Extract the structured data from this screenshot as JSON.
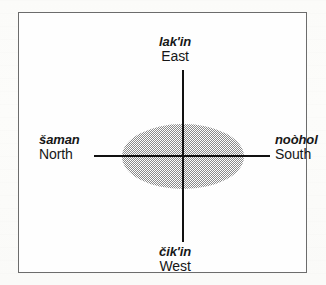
{
  "figure": {
    "type": "cardinal-direction-diagram",
    "frame": {
      "visible": true,
      "border_color": "#6c6c6c"
    },
    "ellipse": {
      "fill": "#8a8a8a",
      "pattern": "50-percent-dither",
      "outline": "none"
    },
    "axes": {
      "color": "#111111",
      "vertical": true,
      "horizontal": true
    }
  },
  "labels": {
    "east": {
      "native": "lak'in",
      "gloss": "East"
    },
    "west": {
      "native": "čik'in",
      "gloss": "West"
    },
    "north": {
      "native": "šaman",
      "gloss": "North"
    },
    "south": {
      "native": "noòhol",
      "gloss": "South"
    }
  }
}
